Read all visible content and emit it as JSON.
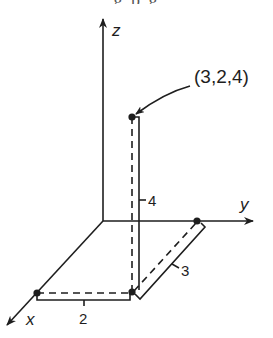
{
  "header": {
    "cropped_text": "g p g"
  },
  "diagram": {
    "axes": {
      "x_label": "x",
      "y_label": "y",
      "z_label": "z"
    },
    "point": {
      "label": "(3,2,4)",
      "coords": [
        3,
        2,
        4
      ]
    },
    "dimensions": {
      "x_length_label": "2",
      "y_length_label": "3",
      "z_length_label": "4"
    },
    "colors": {
      "ink": "#1e1e1e",
      "background": "#ffffff"
    }
  }
}
